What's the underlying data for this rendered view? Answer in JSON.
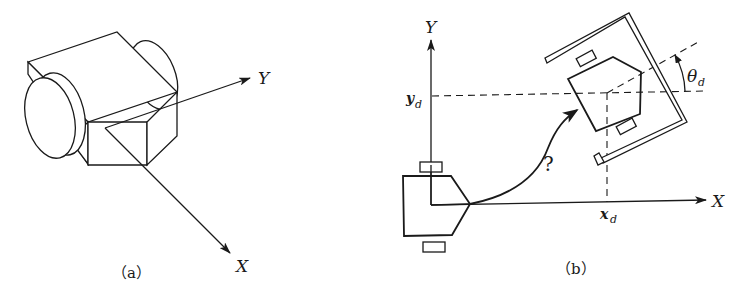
{
  "panel_a": {
    "caption": "（a）",
    "axes": {
      "x_label": "X",
      "y_label": "Y"
    },
    "description": "3D isometric view of a two-wheeled mobile robot with body-fixed X and Y axes"
  },
  "panel_b": {
    "caption": "（b）",
    "axes": {
      "x_label": "X",
      "y_label": "Y"
    },
    "target": {
      "x_label": "x",
      "x_sub": "d",
      "y_label": "y",
      "y_sub": "d",
      "theta_label": "θ",
      "theta_sub": "d"
    },
    "path_label": "?",
    "description": "Top view: robot at origin must reach goal pose (x_d, y_d, θ_d) inside a parking bay"
  },
  "colors": {
    "ink": "#1a1a1a",
    "background": "#ffffff"
  }
}
